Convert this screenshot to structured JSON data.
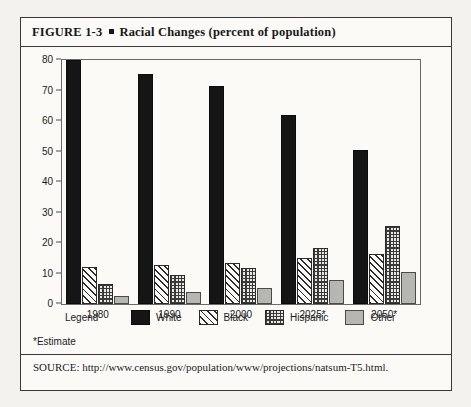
{
  "figure": {
    "number_label": "FIGURE  1-3",
    "bullet": "square-bullet",
    "title": "Racial Changes (percent of population)"
  },
  "footnote": "*Estimate",
  "source": "SOURCE: http://www.census.gov/population/www/projections/natsum-T5.html.",
  "legend": {
    "title": "Legend",
    "items": [
      {
        "label": "White",
        "pattern": "solid-black",
        "color": "#151515"
      },
      {
        "label": "Black",
        "pattern": "diagonal-hatch",
        "color": "#2b2b2b"
      },
      {
        "label": "Hispanic",
        "pattern": "checkerboard",
        "color": "#3a3a3a"
      },
      {
        "label": "Other",
        "pattern": "solid-light-gray",
        "color": "#b6b6b2"
      }
    ]
  },
  "axis": {
    "y_ticks": [
      "0",
      "10",
      "20",
      "30",
      "40",
      "50",
      "60",
      "70",
      "80"
    ],
    "x_ticks": [
      "1980",
      "1990",
      "2000",
      "2025*",
      "2050*"
    ]
  },
  "chart_data": {
    "type": "bar",
    "title": "Racial Changes (percent of population)",
    "xlabel": "",
    "ylabel": "",
    "ylim": [
      0,
      80
    ],
    "ytick_step": 10,
    "grid": false,
    "legend_position": "below-plot",
    "categories": [
      "1980",
      "1990",
      "2000",
      "2025*",
      "2050*"
    ],
    "series": [
      {
        "name": "White",
        "values": [
          80.0,
          75.5,
          71.5,
          62.0,
          50.5
        ]
      },
      {
        "name": "Black",
        "values": [
          12.0,
          12.8,
          13.6,
          15.0,
          16.5
        ]
      },
      {
        "name": "Hispanic",
        "values": [
          6.5,
          9.5,
          11.8,
          18.5,
          25.5
        ]
      },
      {
        "name": "Other",
        "values": [
          2.5,
          4.0,
          5.4,
          8.0,
          10.5
        ]
      }
    ],
    "notes": [
      "*Estimate"
    ],
    "source": "http://www.census.gov/population/www/projections/natsum-T5.html"
  }
}
